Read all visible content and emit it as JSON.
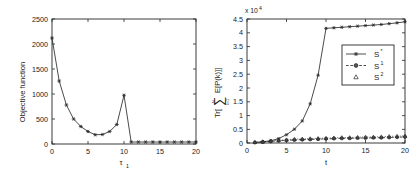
{
  "figure": {
    "background": "#ffffff",
    "ink_color": "#262626"
  },
  "chart_data": [
    {
      "id": "left-panel",
      "type": "line",
      "title": "",
      "xlabel": "τ",
      "xlabel_sub": "1",
      "ylabel": "Objective function",
      "xlim": [
        0,
        20
      ],
      "ylim": [
        0,
        2500
      ],
      "xticks": [
        0,
        5,
        10,
        15,
        20
      ],
      "xticklabels": [
        "0",
        "5",
        "10",
        "15",
        "20"
      ],
      "yticks": [
        0,
        500,
        1000,
        1500,
        2000,
        2500
      ],
      "yticklabels": [
        "0",
        "500",
        "1000",
        "1500",
        "2000",
        "2500"
      ],
      "grid": false,
      "legend": null,
      "series": [
        {
          "name": "objective",
          "marker": "star",
          "linestyle": "solid",
          "color": "#2b2b2b",
          "x": [
            0,
            1,
            2,
            3,
            4,
            5,
            6,
            7,
            8,
            9,
            10,
            11,
            12,
            13,
            14,
            15,
            16,
            17,
            18,
            19,
            20
          ],
          "values": [
            2120,
            1260,
            780,
            500,
            350,
            250,
            185,
            190,
            250,
            390,
            975,
            40,
            40,
            40,
            40,
            40,
            40,
            40,
            40,
            40,
            40
          ]
        }
      ]
    },
    {
      "id": "right-panel",
      "type": "line",
      "title": "",
      "xlabel": "t",
      "ylabel": "Tr[Σ E[P(k)]]",
      "ylabel_parts": {
        "prefix": "Tr[",
        "sum": "∑",
        "sum_upper": "N",
        "sum_lower": "k=1",
        "body": "E[P(k)]]"
      },
      "y_multiplier": "x 10",
      "y_multiplier_exp": "4",
      "xlim": [
        0,
        20
      ],
      "ylim": [
        0,
        4.5
      ],
      "xticks": [
        0,
        5,
        10,
        15,
        20
      ],
      "xticklabels": [
        "0",
        "5",
        "10",
        "15",
        "20"
      ],
      "yticks": [
        0,
        0.5,
        1,
        1.5,
        2,
        2.5,
        3,
        3.5,
        4,
        4.5
      ],
      "yticklabels": [
        "0",
        "0.5",
        "1",
        "1.5",
        "2",
        "2.5",
        "3",
        "3.5",
        "4",
        "4.5"
      ],
      "grid": false,
      "legend": {
        "position": "center-right",
        "entries": [
          {
            "label": "S",
            "sup": "*",
            "marker": "star",
            "linestyle": "solid"
          },
          {
            "label": "S",
            "sup": "1",
            "marker": "circle",
            "linestyle": "dashed"
          },
          {
            "label": "S",
            "sup": "2",
            "marker": "triangle",
            "linestyle": "dotted"
          }
        ]
      },
      "series": [
        {
          "name": "S*",
          "marker": "star",
          "linestyle": "solid",
          "color": "#2b2b2b",
          "x": [
            1,
            2,
            3,
            4,
            5,
            6,
            7,
            8,
            9,
            10,
            11,
            12,
            13,
            14,
            15,
            16,
            17,
            18,
            19,
            20
          ],
          "values": [
            0.02,
            0.04,
            0.08,
            0.16,
            0.3,
            0.5,
            0.8,
            1.42,
            2.46,
            4.16,
            4.18,
            4.2,
            4.22,
            4.24,
            4.26,
            4.28,
            4.3,
            4.33,
            4.36,
            4.4
          ]
        },
        {
          "name": "S1",
          "marker": "circle",
          "linestyle": "dashed",
          "color": "#2b2b2b",
          "x": [
            1,
            2,
            3,
            4,
            5,
            6,
            7,
            8,
            9,
            10,
            11,
            12,
            13,
            14,
            15,
            16,
            17,
            18,
            19,
            20
          ],
          "values": [
            0.02,
            0.04,
            0.06,
            0.08,
            0.1,
            0.11,
            0.12,
            0.13,
            0.14,
            0.15,
            0.16,
            0.17,
            0.17,
            0.18,
            0.18,
            0.19,
            0.19,
            0.2,
            0.21,
            0.22
          ]
        },
        {
          "name": "S2",
          "marker": "triangle",
          "linestyle": "dotted",
          "color": "#2b2b2b",
          "x": [
            1,
            2,
            3,
            4,
            5,
            6,
            7,
            8,
            9,
            10,
            11,
            12,
            13,
            14,
            15,
            16,
            17,
            18,
            19,
            20
          ],
          "values": [
            0.03,
            0.05,
            0.08,
            0.1,
            0.12,
            0.14,
            0.15,
            0.16,
            0.17,
            0.18,
            0.19,
            0.2,
            0.2,
            0.21,
            0.22,
            0.22,
            0.23,
            0.24,
            0.25,
            0.26
          ]
        }
      ]
    }
  ]
}
